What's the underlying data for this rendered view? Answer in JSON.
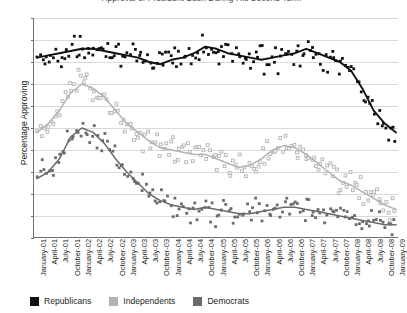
{
  "title": "Approval of President Bush During His Second Term",
  "axes": {
    "ylabel": "Percentage Approving",
    "yticks": [
      "0",
      "10",
      "20",
      "30",
      "40",
      "50",
      "60",
      "70",
      "80",
      "90",
      "100"
    ],
    "xlabels": [
      "January-01",
      "April-01",
      "July-01",
      "October-01",
      "January-02",
      "April-02",
      "July-02",
      "October-02",
      "January-03",
      "April-03",
      "July-03",
      "October-03",
      "January-04",
      "April-04",
      "July-04",
      "October-04",
      "January-05",
      "April-05",
      "July-05",
      "October-05",
      "January-06",
      "April-06",
      "July-06",
      "October-06",
      "January-07",
      "April-07",
      "July-07",
      "October-07",
      "January-08",
      "April-08",
      "July-08",
      "October-08",
      "January-09"
    ]
  },
  "legend": [
    {
      "label": "Republicans",
      "color": "#111111"
    },
    {
      "label": "Independents",
      "color": "#b3b3b3"
    },
    {
      "label": "Democrats",
      "color": "#6b6b6b"
    }
  ],
  "chart_data": {
    "type": "scatter",
    "title": "Approval of President Bush During His Second Term",
    "xlabel": "",
    "ylabel": "Percentage Approving",
    "ylim": [
      0,
      100
    ],
    "xlim": [
      "January-01",
      "January-09"
    ],
    "grid": true,
    "legend_position": "bottom",
    "x": [
      "January-01",
      "April-01",
      "July-01",
      "October-01",
      "January-02",
      "April-02",
      "July-02",
      "October-02",
      "January-03",
      "April-03",
      "July-03",
      "October-03",
      "January-04",
      "April-04",
      "July-04",
      "October-04",
      "January-05",
      "April-05",
      "July-05",
      "October-05",
      "January-06",
      "April-06",
      "July-06",
      "October-06",
      "January-07",
      "April-07",
      "July-07",
      "October-07",
      "January-08",
      "April-08",
      "July-08",
      "October-08",
      "January-09"
    ],
    "series": [
      {
        "name": "Republicans",
        "color": "#111111",
        "marker": "filled-square",
        "trend_values": [
          82,
          83,
          84,
          85,
          86,
          86,
          85,
          84,
          83,
          82,
          80,
          79,
          81,
          82,
          84,
          87,
          86,
          84,
          83,
          82,
          81,
          82,
          83,
          84,
          86,
          84,
          82,
          80,
          76,
          68,
          58,
          52,
          48
        ]
      },
      {
        "name": "Independents",
        "color": "#b3b3b3",
        "marker": "open-square",
        "trend_values": [
          48,
          52,
          58,
          66,
          70,
          68,
          64,
          58,
          52,
          48,
          44,
          41,
          40,
          39,
          38,
          38,
          36,
          34,
          32,
          33,
          36,
          40,
          42,
          41,
          38,
          34,
          30,
          26,
          24,
          21,
          18,
          15,
          13
        ]
      },
      {
        "name": "Democrats",
        "color": "#6b6b6b",
        "marker": "filled-square",
        "trend_values": [
          27,
          30,
          36,
          46,
          50,
          48,
          43,
          36,
          30,
          25,
          20,
          17,
          15,
          14,
          13,
          14,
          13,
          12,
          11,
          11,
          12,
          13,
          14,
          14,
          13,
          12,
          11,
          10,
          9,
          8,
          7,
          6,
          6
        ]
      }
    ]
  }
}
